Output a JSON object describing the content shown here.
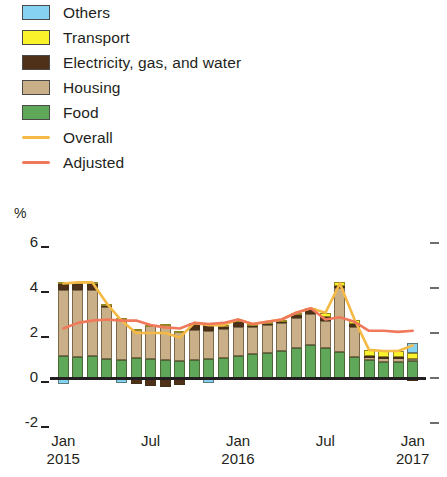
{
  "legend": {
    "items": [
      {
        "label": "Others",
        "kind": "swatch",
        "color": "#86D2F2"
      },
      {
        "label": "Transport",
        "kind": "swatch",
        "color": "#FAF22B"
      },
      {
        "label": "Electricity, gas, and water",
        "kind": "swatch",
        "color": "#4E3118"
      },
      {
        "label": "Housing",
        "kind": "swatch",
        "color": "#C9B088"
      },
      {
        "label": "Food",
        "kind": "swatch",
        "color": "#5FA85A"
      },
      {
        "label": "Overall",
        "kind": "line",
        "color": "#F5B945"
      },
      {
        "label": "Adjusted",
        "kind": "line",
        "color": "#F0795B"
      }
    ]
  },
  "axis": {
    "unit_label": "%",
    "y_ticks": [
      6,
      4,
      2,
      0,
      -2
    ],
    "x_ticks": [
      {
        "month": "Jan",
        "year": "2015",
        "index": 0
      },
      {
        "month": "Jul",
        "year": "",
        "index": 6
      },
      {
        "month": "Jan",
        "year": "2016",
        "index": 12
      },
      {
        "month": "Jul",
        "year": "",
        "index": 18
      },
      {
        "month": "Jan",
        "year": "2017",
        "index": 24
      }
    ]
  },
  "chart_data": {
    "type": "bar",
    "title": "",
    "xlabel": "",
    "ylabel": "%",
    "ylim": [
      -2,
      6
    ],
    "grid": false,
    "legend_position": "top-left",
    "stacked": true,
    "categories": [
      "Jan 2015",
      "Feb 2015",
      "Mar 2015",
      "Apr 2015",
      "May 2015",
      "Jun 2015",
      "Jul 2015",
      "Aug 2015",
      "Sep 2015",
      "Oct 2015",
      "Nov 2015",
      "Dec 2015",
      "Jan 2016",
      "Feb 2016",
      "Mar 2016",
      "Apr 2016",
      "May 2016",
      "Jun 2016",
      "Jul 2016",
      "Aug 2016",
      "Sep 2016",
      "Oct 2016",
      "Nov 2016",
      "Dec 2016",
      "Jan 2017"
    ],
    "series": [
      {
        "name": "Food",
        "color": "#5FA85A",
        "values": [
          1.0,
          0.95,
          1.0,
          0.85,
          0.8,
          0.9,
          0.85,
          0.8,
          0.75,
          0.8,
          0.85,
          0.9,
          1.0,
          1.05,
          1.1,
          1.2,
          1.35,
          1.45,
          1.35,
          1.15,
          0.95,
          0.8,
          0.7,
          0.7,
          0.75
        ]
      },
      {
        "name": "Housing",
        "color": "#C9B088",
        "values": [
          2.9,
          2.95,
          2.9,
          2.3,
          1.8,
          1.25,
          1.45,
          1.55,
          1.3,
          1.35,
          1.25,
          1.3,
          1.25,
          1.2,
          1.25,
          1.25,
          1.3,
          1.4,
          1.2,
          2.85,
          1.3,
          0.15,
          0.2,
          0.2,
          0.1
        ]
      },
      {
        "name": "Electricity, gas, and water",
        "color": "#4E3118",
        "values": [
          0.3,
          0.3,
          0.3,
          0.1,
          -0.05,
          -0.25,
          -0.35,
          -0.4,
          -0.3,
          0.25,
          0.3,
          0.1,
          0.3,
          0.1,
          0.1,
          0.1,
          0.2,
          0.2,
          0.15,
          0.1,
          0.15,
          0.05,
          0.05,
          0.05,
          -0.15
        ]
      },
      {
        "name": "Transport",
        "color": "#FAF22B",
        "values": [
          0.05,
          0.05,
          0.05,
          0.05,
          0.05,
          0.05,
          0.05,
          0.05,
          0.05,
          0.05,
          0.05,
          0.05,
          0.05,
          0.05,
          0.05,
          0.05,
          0.05,
          0.05,
          0.2,
          0.15,
          0.2,
          0.25,
          0.25,
          0.25,
          0.25
        ]
      },
      {
        "name": "Others",
        "color": "#86D2F2",
        "values": [
          -0.25,
          0.0,
          0.0,
          0.0,
          -0.15,
          0.0,
          0.0,
          0.0,
          0.0,
          0.0,
          -0.2,
          0.0,
          0.0,
          0.0,
          0.0,
          0.0,
          0.0,
          0.0,
          0.0,
          0.0,
          0.0,
          0.0,
          0.0,
          0.0,
          0.45
        ]
      }
    ],
    "lines": [
      {
        "name": "Overall",
        "color": "#F5B945",
        "values": [
          4.2,
          4.25,
          4.25,
          3.3,
          2.55,
          2.0,
          2.0,
          2.0,
          1.8,
          2.45,
          2.35,
          2.35,
          2.6,
          2.4,
          2.5,
          2.6,
          2.9,
          3.1,
          2.9,
          4.2,
          2.6,
          1.25,
          1.2,
          1.2,
          1.45
        ]
      },
      {
        "name": "Adjusted",
        "color": "#F0795B",
        "values": [
          2.2,
          2.45,
          2.55,
          2.6,
          2.55,
          2.55,
          2.35,
          2.25,
          2.2,
          2.45,
          2.4,
          2.45,
          2.6,
          2.4,
          2.5,
          2.6,
          2.9,
          3.1,
          2.6,
          2.7,
          2.5,
          2.1,
          2.1,
          2.05,
          2.1
        ]
      }
    ]
  }
}
